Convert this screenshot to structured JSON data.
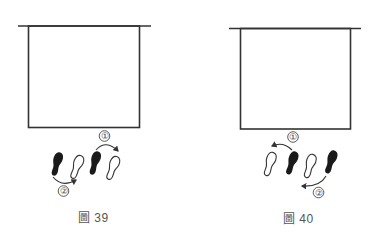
{
  "colors": {
    "line": "#333333",
    "shoe_fill": "#1a1a1a",
    "caption": "#555555"
  },
  "figures": [
    {
      "caption": "圖 39",
      "steps": [
        {
          "label": "①",
          "description": "right foot steps forward-right over"
        },
        {
          "label": "②",
          "description": "left foot follows"
        }
      ],
      "footprints": [
        "black",
        "outline",
        "black",
        "outline"
      ]
    },
    {
      "caption": "圖 40",
      "steps": [
        {
          "label": "①",
          "description": "foot steps back-left"
        },
        {
          "label": "②",
          "description": "foot follows back-left"
        }
      ],
      "footprints": [
        "outline",
        "black",
        "outline",
        "black"
      ]
    }
  ],
  "markers": {
    "one": "①",
    "two": "②"
  }
}
